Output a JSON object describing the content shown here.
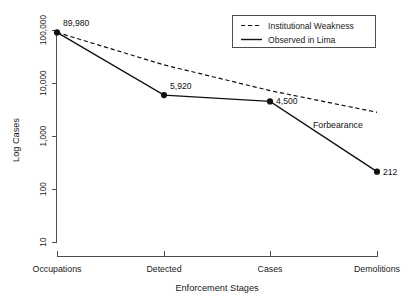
{
  "chart_data": {
    "type": "line",
    "title": "",
    "xlabel": "Enforcement Stages",
    "ylabel": "Log Cases",
    "categories": [
      "Occupations",
      "Detected",
      "Cases",
      "Demolitions"
    ],
    "yscale": "log",
    "ylim": [
      10,
      100000
    ],
    "yticks": [
      10,
      100,
      1000,
      10000,
      100000
    ],
    "ytick_labels": [
      "10",
      "100",
      "1,000",
      "10,000",
      "100,000"
    ],
    "grid": false,
    "legend_position": "top-right",
    "series": [
      {
        "name": "Institutional Weakness",
        "style": "dashed",
        "marker": "none",
        "color": "#111111",
        "values": [
          89980,
          22000,
          7200,
          2800
        ],
        "point_labels": [
          "",
          "",
          "",
          ""
        ]
      },
      {
        "name": "Observed in Lima",
        "style": "solid",
        "marker": "filled-circle",
        "color": "#111111",
        "values": [
          89980,
          5920,
          4500,
          212
        ],
        "point_labels": [
          "89,980",
          "5,920",
          "4,500",
          "212"
        ]
      }
    ],
    "annotations": [
      {
        "text": "Forbearance",
        "x_category": "Cases",
        "note": "between dashed baseline and observed line"
      }
    ]
  },
  "legend": {
    "entries": [
      {
        "label": "Institutional Weakness",
        "style": "dashed"
      },
      {
        "label": "Observed in Lima",
        "style": "solid"
      }
    ]
  },
  "axes": {
    "y_title": "Log Cases",
    "x_title": "Enforcement Stages",
    "y_tick_labels": [
      "100,000",
      "10,000",
      "1,000",
      "100",
      "10"
    ],
    "x_tick_labels": [
      "Occupations",
      "Detected",
      "Cases",
      "Demolitions"
    ]
  },
  "point_labels": {
    "p0": "89,980",
    "p1": "5,920",
    "p2": "4,500",
    "p3": "212"
  },
  "annotation": {
    "forbearance": "Forbearance"
  },
  "colors": {
    "line": "#111111",
    "axis": "#4d4d4d",
    "background": "#ffffff"
  }
}
